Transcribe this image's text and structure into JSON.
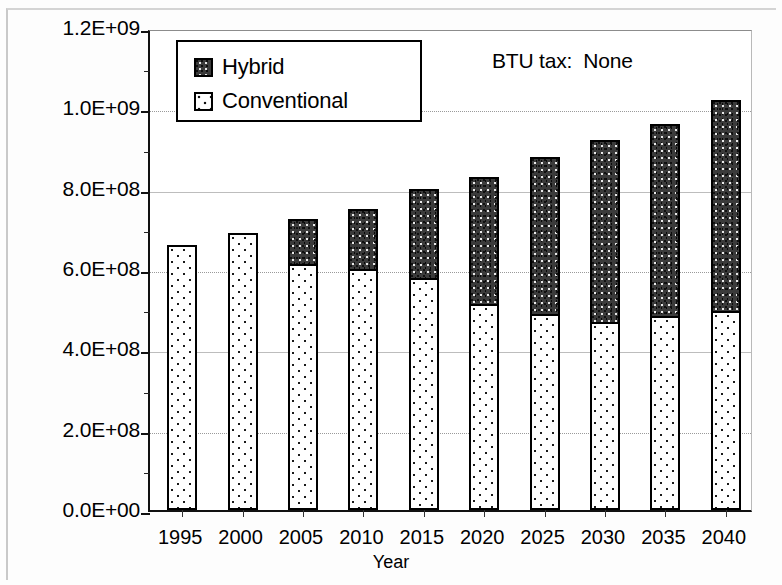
{
  "chart_data": {
    "type": "bar",
    "stacked": true,
    "title": "",
    "subtitle": "",
    "xlabel": "Year",
    "ylabel": "",
    "categories": [
      "1995",
      "2000",
      "2005",
      "2010",
      "2015",
      "2020",
      "2025",
      "2030",
      "2035",
      "2040"
    ],
    "series": [
      {
        "name": "Conventional",
        "values": [
          660000000,
          690000000,
          612000000,
          600000000,
          578000000,
          513000000,
          488000000,
          468000000,
          483000000,
          495000000
        ]
      },
      {
        "name": "Hybrid",
        "values": [
          0,
          0,
          112000000,
          150000000,
          222000000,
          317000000,
          392000000,
          452000000,
          477000000,
          525000000
        ]
      }
    ],
    "totals": [
      660000000,
      690000000,
      724000000,
      750000000,
      800000000,
      830000000,
      880000000,
      920000000,
      960000000,
      1020000000
    ],
    "ylim": [
      0,
      1200000000
    ],
    "ytick_values": [
      0,
      200000000,
      400000000,
      600000000,
      800000000,
      1000000000,
      1200000000
    ],
    "ytick_labels": [
      "0.0E+00",
      "2.0E+08",
      "4.0E+08",
      "6.0E+08",
      "8.0E+08",
      "1.0E+09",
      "1.2E+09"
    ],
    "minor_ticks": true,
    "grid": true,
    "grid_axis": "y",
    "legend_position": "top-left",
    "annotations": [
      "BTU tax:  None"
    ],
    "colors": {
      "hybrid": "#3b3b3b",
      "conventional": "#ffffff",
      "axis": "#111111",
      "grid": "#9a9a9a"
    }
  },
  "legend": {
    "items": [
      {
        "label": "Hybrid",
        "key": "hybrid"
      },
      {
        "label": "Conventional",
        "key": "conventional"
      }
    ]
  },
  "annotation": {
    "text": "BTU tax:  None"
  },
  "axes": {
    "x_title": "Year"
  }
}
